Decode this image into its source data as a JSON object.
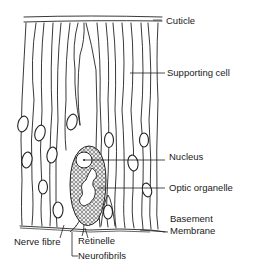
{
  "diagram": {
    "labels": {
      "cuticle": "Cuticle",
      "supporting_cell": "Supporting cell",
      "nucleus": "Nucleus",
      "optic_organelle": "Optic organelle",
      "basement_membrane_line1": "Basement",
      "basement_membrane_line2": "Membrane",
      "nerve_fibre": "Nerve fibre",
      "retinelle": "Retinelle",
      "neurofibrils": "Neurofibrils"
    },
    "colors": {
      "ink": "#222222",
      "background": "#ffffff"
    }
  }
}
